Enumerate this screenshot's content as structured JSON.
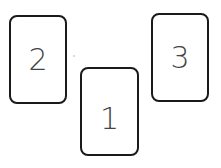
{
  "cards": [
    {
      "label": "2",
      "x": 9,
      "y": 15,
      "w": 58,
      "h": 89
    },
    {
      "label": "1",
      "x": 80,
      "y": 67,
      "w": 59,
      "h": 89
    },
    {
      "label": "3",
      "x": 151,
      "y": 13,
      "w": 58,
      "h": 89
    }
  ]
}
